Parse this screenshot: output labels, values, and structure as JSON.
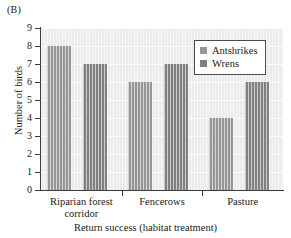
{
  "panel": {
    "label": "(B)"
  },
  "chart_data": {
    "type": "bar",
    "title": "",
    "panel_label": "(B)",
    "categories": [
      "Riparian forest corridor",
      "Fencerows",
      "Pasture"
    ],
    "series": [
      {
        "name": "Antshrikes",
        "values": [
          8,
          6,
          4
        ],
        "color": "#969696"
      },
      {
        "name": "Wrens",
        "values": [
          7,
          7,
          6
        ],
        "color": "#808080"
      }
    ],
    "xlabel": "Return success (habitat treatment)",
    "ylabel": "Number of birds",
    "ylim": [
      0,
      9
    ],
    "yticks": [
      0,
      1,
      2,
      3,
      4,
      5,
      6,
      7,
      8,
      9
    ],
    "ytick_labels": [
      "0",
      "1",
      "2",
      "3",
      "4",
      "5",
      "6",
      "7",
      "8",
      "9"
    ],
    "grid": true,
    "legend_position": "top-right",
    "plot_background": "#ebebeb"
  },
  "legend": {
    "entries": [
      {
        "label": "Antshrikes",
        "color": "#969696"
      },
      {
        "label": "Wrens",
        "color": "#808080"
      }
    ]
  },
  "axes": {
    "x_title": "Return success (habitat treatment)",
    "y_title": "Number of birds",
    "x_categories": [
      {
        "line1": "Riparian forest",
        "line2": "corridor"
      },
      {
        "line1": "Fencerows",
        "line2": ""
      },
      {
        "line1": "Pasture",
        "line2": ""
      }
    ]
  }
}
